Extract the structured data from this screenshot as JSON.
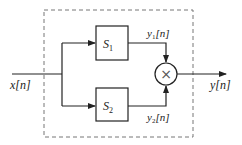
{
  "diagram": {
    "input_label": "x[n]",
    "output_label": "y[n]",
    "blocks": [
      {
        "name": "S",
        "sub": "1",
        "output": {
          "base": "y",
          "sub": "1",
          "arg": "[n]"
        }
      },
      {
        "name": "S",
        "sub": "2",
        "output": {
          "base": "y",
          "sub": "2",
          "arg": "[n]"
        }
      }
    ],
    "combiner": "×",
    "colors": {
      "line": "#222222",
      "dashed": "#777777",
      "background": "#ffffff"
    }
  }
}
